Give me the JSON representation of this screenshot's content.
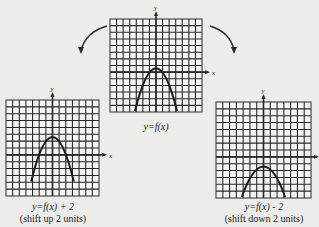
{
  "colors": {
    "background": "#ececea",
    "grid": "#2a2a2a",
    "curve": "#1a1a1a",
    "cell": "#f3f3f1"
  },
  "panels": [
    {
      "id": "original",
      "equation": "y=f(x)",
      "note": "",
      "axis_y": "y",
      "axis_x": "x",
      "vertex_offset_cells": 0
    },
    {
      "id": "shift-up",
      "equation": "y=f(x) + 2",
      "note": "(shift up 2 units)",
      "axis_y": "y",
      "axis_x": "x",
      "vertex_offset_cells": -2
    },
    {
      "id": "shift-down",
      "equation": "y=f(x) - 2",
      "note": "(shift down 2 units)",
      "axis_y": "y",
      "axis_x": "",
      "vertex_offset_cells": 2
    }
  ],
  "arrows": [
    {
      "from": "original",
      "to": "shift-up",
      "direction": "left-down"
    },
    {
      "from": "original",
      "to": "shift-down",
      "direction": "right-down"
    }
  ]
}
